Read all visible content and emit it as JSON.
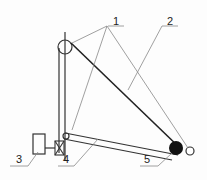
{
  "diagram": {
    "type": "mechanical schematic",
    "labels": [
      {
        "id": "1",
        "text": "1",
        "x": 113,
        "y": 16
      },
      {
        "id": "2",
        "text": "2",
        "x": 167,
        "y": 16
      },
      {
        "id": "3",
        "text": "3",
        "x": 16,
        "y": 150
      },
      {
        "id": "4",
        "text": "4",
        "x": 63,
        "y": 150
      },
      {
        "id": "5",
        "text": "5",
        "x": 144,
        "y": 150
      }
    ],
    "colors": {
      "line": "#333333",
      "thin": "#777777",
      "fill": "#111111"
    }
  }
}
